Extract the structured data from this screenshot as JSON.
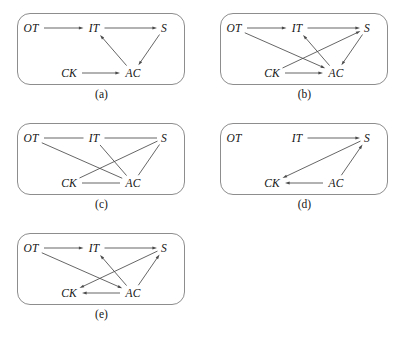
{
  "figure": {
    "node_labels": {
      "OT": "OT",
      "IT": "IT",
      "S": "S",
      "CK": "CK",
      "AC": "AC"
    },
    "node_positions": {
      "OT": {
        "x": 14,
        "y": 15
      },
      "IT": {
        "x": 77,
        "y": 15
      },
      "S": {
        "x": 147,
        "y": 15
      },
      "CK": {
        "x": 52,
        "y": 60
      },
      "AC": {
        "x": 116,
        "y": 60
      }
    },
    "edge_color": "#4a4a4a",
    "border_color": "#8d8d8d",
    "panels": [
      {
        "id": "a",
        "caption": "(a)",
        "directed": true,
        "nodes": [
          "OT",
          "IT",
          "S",
          "CK",
          "AC"
        ],
        "edges": [
          {
            "from": "OT",
            "to": "IT"
          },
          {
            "from": "IT",
            "to": "S"
          },
          {
            "from": "AC",
            "to": "IT"
          },
          {
            "from": "S",
            "to": "AC"
          },
          {
            "from": "CK",
            "to": "AC"
          }
        ]
      },
      {
        "id": "b",
        "caption": "(b)",
        "directed": true,
        "nodes": [
          "OT",
          "IT",
          "S",
          "CK",
          "AC"
        ],
        "edges": [
          {
            "from": "OT",
            "to": "IT"
          },
          {
            "from": "IT",
            "to": "S"
          },
          {
            "from": "OT",
            "to": "AC"
          },
          {
            "from": "CK",
            "to": "S"
          },
          {
            "from": "AC",
            "to": "IT"
          },
          {
            "from": "S",
            "to": "AC"
          },
          {
            "from": "CK",
            "to": "AC"
          }
        ]
      },
      {
        "id": "c",
        "caption": "(c)",
        "directed": false,
        "nodes": [
          "OT",
          "IT",
          "S",
          "CK",
          "AC"
        ],
        "edges": [
          {
            "from": "OT",
            "to": "IT"
          },
          {
            "from": "IT",
            "to": "S"
          },
          {
            "from": "OT",
            "to": "AC"
          },
          {
            "from": "CK",
            "to": "S"
          },
          {
            "from": "IT",
            "to": "AC"
          },
          {
            "from": "S",
            "to": "AC"
          },
          {
            "from": "CK",
            "to": "AC"
          }
        ]
      },
      {
        "id": "d",
        "caption": "(d)",
        "directed": true,
        "nodes": [
          "OT",
          "IT",
          "S",
          "CK",
          "AC"
        ],
        "edges": [
          {
            "from": "IT",
            "to": "S"
          },
          {
            "from": "S",
            "to": "CK"
          },
          {
            "from": "AC",
            "to": "S"
          },
          {
            "from": "AC",
            "to": "CK"
          }
        ]
      },
      {
        "id": "e",
        "caption": "(e)",
        "directed": true,
        "nodes": [
          "OT",
          "IT",
          "S",
          "CK",
          "AC"
        ],
        "edges": [
          {
            "from": "OT",
            "to": "IT"
          },
          {
            "from": "IT",
            "to": "S"
          },
          {
            "from": "OT",
            "to": "AC"
          },
          {
            "from": "S",
            "to": "CK"
          },
          {
            "from": "AC",
            "to": "IT"
          },
          {
            "from": "AC",
            "to": "S"
          },
          {
            "from": "AC",
            "to": "CK"
          }
        ]
      }
    ]
  }
}
